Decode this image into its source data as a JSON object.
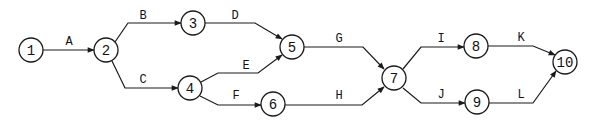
{
  "diagram": {
    "type": "activity-on-arrow network",
    "nodes": [
      {
        "id": "1",
        "label": "1",
        "x": 31,
        "y": 50
      },
      {
        "id": "2",
        "label": "2",
        "x": 106,
        "y": 50
      },
      {
        "id": "3",
        "label": "3",
        "x": 193,
        "y": 23
      },
      {
        "id": "4",
        "label": "4",
        "x": 190,
        "y": 88
      },
      {
        "id": "5",
        "label": "5",
        "x": 292,
        "y": 47
      },
      {
        "id": "6",
        "label": "6",
        "x": 273,
        "y": 104
      },
      {
        "id": "7",
        "label": "7",
        "x": 394,
        "y": 78
      },
      {
        "id": "8",
        "label": "8",
        "x": 476,
        "y": 46
      },
      {
        "id": "9",
        "label": "9",
        "x": 477,
        "y": 102
      },
      {
        "id": "10",
        "label": "10",
        "x": 565,
        "y": 62
      }
    ],
    "edges": [
      {
        "label": "A",
        "from": "1",
        "to": "2",
        "path": "M43,50 L94,50",
        "lx": 69,
        "ly": 45
      },
      {
        "label": "B",
        "from": "2",
        "to": "3",
        "path": "M115,42 L128,23 L181,23",
        "lx": 143,
        "ly": 19
      },
      {
        "label": "C",
        "from": "2",
        "to": "4",
        "path": "M112,61 L125,88 L178,88",
        "lx": 143,
        "ly": 83
      },
      {
        "label": "D",
        "from": "3",
        "to": "5",
        "path": "M205,23 L255,23 L282,39",
        "lx": 235,
        "ly": 19
      },
      {
        "label": "E",
        "from": "4",
        "to": "5",
        "path": "M201,82 L218,73 L258,73 L282,55",
        "lx": 246,
        "ly": 69
      },
      {
        "label": "F",
        "from": "4",
        "to": "6",
        "path": "M200,96 L218,105 L261,105",
        "lx": 236,
        "ly": 99
      },
      {
        "label": "G",
        "from": "5",
        "to": "7",
        "path": "M304,47 L363,47 L384,69",
        "lx": 339,
        "ly": 42
      },
      {
        "label": "H",
        "from": "6",
        "to": "7",
        "path": "M285,105 L362,105 L384,87",
        "lx": 339,
        "ly": 99
      },
      {
        "label": "I",
        "from": "7",
        "to": "8",
        "path": "M403,69 L421,47 L464,47",
        "lx": 441,
        "ly": 42
      },
      {
        "label": "J",
        "from": "7",
        "to": "9",
        "path": "M403,88 L421,103 L465,103",
        "lx": 441,
        "ly": 98
      },
      {
        "label": "K",
        "from": "8",
        "to": "10",
        "path": "M488,46 L533,46 L555,55",
        "lx": 521,
        "ly": 41
      },
      {
        "label": "L",
        "from": "9",
        "to": "10",
        "path": "M489,103 L533,103 L556,71",
        "lx": 521,
        "ly": 98
      }
    ]
  }
}
